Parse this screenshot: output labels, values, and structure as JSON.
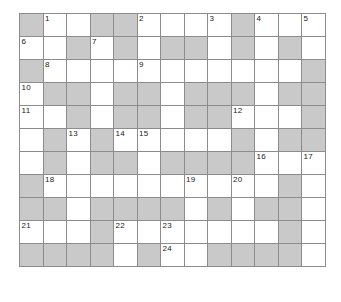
{
  "puzzle": {
    "type": "crossword-grid",
    "columns": 13,
    "rows": 11,
    "cell_width_px": 23.5,
    "cell_height_px": 23,
    "grid_origin": {
      "x": 19,
      "y": 13
    },
    "colors": {
      "background": "#ffffff",
      "open_cell": "#ffffff",
      "blocked_cell": "#c9c9c9",
      "grid_line": "#8c8c8c",
      "number_text": "#1a1a1a"
    },
    "legend": {
      "open": "o",
      "blocked": "x"
    },
    "cells": [
      [
        "x",
        "o",
        "o",
        "x",
        "x",
        "o",
        "o",
        "o",
        "o",
        "x",
        "o",
        "o",
        "o"
      ],
      [
        "o",
        "o",
        "x",
        "o",
        "x",
        "o",
        "x",
        "x",
        "o",
        "x",
        "o",
        "x",
        "o"
      ],
      [
        "x",
        "o",
        "o",
        "o",
        "o",
        "o",
        "o",
        "o",
        "o",
        "o",
        "o",
        "o",
        "x"
      ],
      [
        "o",
        "x",
        "x",
        "o",
        "x",
        "x",
        "o",
        "x",
        "x",
        "x",
        "o",
        "x",
        "x"
      ],
      [
        "o",
        "o",
        "x",
        "o",
        "x",
        "x",
        "o",
        "x",
        "x",
        "o",
        "o",
        "o",
        "x"
      ],
      [
        "o",
        "x",
        "o",
        "x",
        "o",
        "o",
        "o",
        "o",
        "o",
        "x",
        "o",
        "x",
        "x"
      ],
      [
        "o",
        "x",
        "o",
        "x",
        "x",
        "o",
        "x",
        "x",
        "x",
        "x",
        "o",
        "o",
        "o"
      ],
      [
        "x",
        "o",
        "o",
        "o",
        "o",
        "o",
        "o",
        "o",
        "o",
        "o",
        "o",
        "x",
        "o"
      ],
      [
        "x",
        "x",
        "o",
        "x",
        "x",
        "x",
        "x",
        "o",
        "x",
        "o",
        "x",
        "x",
        "o"
      ],
      [
        "o",
        "o",
        "o",
        "x",
        "o",
        "o",
        "o",
        "o",
        "o",
        "o",
        "o",
        "x",
        "o"
      ],
      [
        "x",
        "x",
        "x",
        "x",
        "o",
        "x",
        "o",
        "o",
        "x",
        "x",
        "x",
        "x",
        "o"
      ]
    ],
    "numbers": [
      {
        "row": 1,
        "col": 2,
        "label": "1"
      },
      {
        "row": 1,
        "col": 6,
        "label": "2"
      },
      {
        "row": 1,
        "col": 9,
        "label": "3"
      },
      {
        "row": 1,
        "col": 11,
        "label": "4"
      },
      {
        "row": 1,
        "col": 13,
        "label": "5"
      },
      {
        "row": 2,
        "col": 1,
        "label": "6"
      },
      {
        "row": 2,
        "col": 4,
        "label": "7"
      },
      {
        "row": 3,
        "col": 2,
        "label": "8"
      },
      {
        "row": 3,
        "col": 6,
        "label": "9"
      },
      {
        "row": 4,
        "col": 1,
        "label": "10"
      },
      {
        "row": 5,
        "col": 1,
        "label": "11"
      },
      {
        "row": 5,
        "col": 10,
        "label": "12"
      },
      {
        "row": 6,
        "col": 3,
        "label": "13"
      },
      {
        "row": 6,
        "col": 5,
        "label": "14"
      },
      {
        "row": 6,
        "col": 6,
        "label": "15"
      },
      {
        "row": 7,
        "col": 11,
        "label": "16"
      },
      {
        "row": 7,
        "col": 13,
        "label": "17"
      },
      {
        "row": 8,
        "col": 2,
        "label": "18"
      },
      {
        "row": 8,
        "col": 8,
        "label": "19"
      },
      {
        "row": 8,
        "col": 10,
        "label": "20"
      },
      {
        "row": 10,
        "col": 1,
        "label": "21"
      },
      {
        "row": 10,
        "col": 5,
        "label": "22"
      },
      {
        "row": 10,
        "col": 7,
        "label": "23"
      },
      {
        "row": 11,
        "col": 7,
        "label": "24"
      }
    ]
  }
}
